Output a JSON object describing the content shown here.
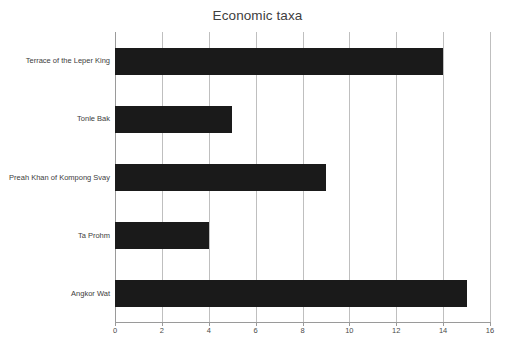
{
  "chart_data": {
    "type": "bar",
    "orientation": "horizontal",
    "title": "Economic taxa",
    "xlabel": "",
    "ylabel": "",
    "categories": [
      "Terrace of the Leper King",
      "Tonle Bak",
      "Preah Khan of Kompong Svay",
      "Ta Prohm",
      "Angkor Wat"
    ],
    "values": [
      14,
      5,
      9,
      4,
      15
    ],
    "xlim": [
      0,
      16
    ],
    "xticks": [
      0,
      2,
      4,
      6,
      8,
      10,
      12,
      14,
      16
    ],
    "xtick_labels": [
      "0",
      "2",
      "4",
      "6",
      "8",
      "10",
      "12",
      "14",
      "16"
    ],
    "grid": "vertical",
    "legend": null,
    "bar_color": "#1a1a1a",
    "gridline_color": "#bfbfbf",
    "axis_color": "#9a9a9a",
    "background_color": "#ffffff",
    "series": [
      {
        "name": "Economic taxa",
        "values": [
          14,
          5,
          9,
          4,
          15
        ]
      }
    ]
  }
}
